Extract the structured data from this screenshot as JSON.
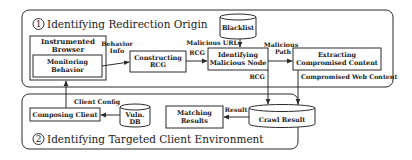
{
  "diagram": {
    "panels": {
      "origin": {
        "number": "1",
        "title": "Identifying Redirection Origin"
      },
      "client": {
        "number": "2",
        "title": "Identifying Targeted Client Environment"
      }
    },
    "nodes": {
      "instrumented_browser": {
        "line1": "Instrumented",
        "line2": "Browser"
      },
      "monitoring_behavior": {
        "line1": "Monitoring",
        "line2": "Behavior"
      },
      "constructing_rcg": {
        "line1": "Constructing",
        "line2": "RCG"
      },
      "blacklist": {
        "label": "Blacklist"
      },
      "identifying_malicious_node": {
        "line1": "Identifying",
        "line2": "Malicious Node"
      },
      "extracting_content": {
        "line1": "Extracting",
        "line2": "Compromised Content"
      },
      "crawl_result": {
        "label": "Crawl Result"
      },
      "matching_results": {
        "line1": "Matching",
        "line2": "Results"
      },
      "vuln_db": {
        "line1": "Vuln.",
        "line2": "DB"
      },
      "composing_client": {
        "label": "Composing Client"
      }
    },
    "edges": {
      "behavior_info": {
        "line1": "Behavior",
        "line2": "Info"
      },
      "rcg_to_identify": "RCG",
      "malicious_url": "Malicious URL",
      "malicious_path": {
        "line1": "Malicious",
        "line2": "Path"
      },
      "rcg_to_crawl": "RCG",
      "compromised_web_content": "Compromised Web Content",
      "result": "Result",
      "client_config": "Client Config"
    }
  }
}
